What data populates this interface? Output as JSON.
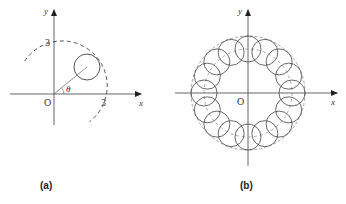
{
  "panels": [
    {
      "id": "a",
      "caption": "(a)",
      "axis_labels": {
        "x": "x",
        "y": "y",
        "origin": "O"
      },
      "tick_labels": {
        "x_radius": "3",
        "y_radius": "3"
      },
      "angle_label": "θ",
      "description": "Circle of small radius centered on a dashed circle of radius 3 at angle θ"
    },
    {
      "id": "b",
      "caption": "(b)",
      "axis_labels": {
        "x": "x",
        "y": "y",
        "origin": "O"
      },
      "ring_circle_count": 16,
      "description": "Ring formed by small circles centered on the dashed circle of radius 3"
    }
  ],
  "colors": {
    "stroke": "#444444",
    "axis": "#555555",
    "background": "#ffffff"
  }
}
